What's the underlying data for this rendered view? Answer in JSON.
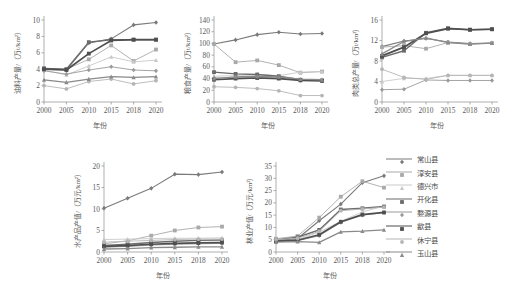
{
  "figure": {
    "xlabel": "年份",
    "x_ticks": [
      "2000",
      "2005",
      "2010",
      "2015",
      "2018",
      "2020"
    ]
  },
  "legend": {
    "position": "right",
    "items": [
      {
        "label": "常山县",
        "color": "#7a7a7a",
        "width": 1.1,
        "marker": "diamond"
      },
      {
        "label": "淳安县",
        "color": "#a9a9a9",
        "width": 0.9,
        "marker": "square"
      },
      {
        "label": "德兴市",
        "color": "#c9c9c9",
        "width": 0.9,
        "marker": "triangle"
      },
      {
        "label": "开化县",
        "color": "#6b6b6b",
        "width": 1.4,
        "marker": "square"
      },
      {
        "label": "婺源县",
        "color": "#9a9a9a",
        "width": 0.9,
        "marker": "diamond"
      },
      {
        "label": "歙县",
        "color": "#4f4f4f",
        "width": 1.7,
        "marker": "square"
      },
      {
        "label": "休宁县",
        "color": "#b5b5b5",
        "width": 0.9,
        "marker": "circle"
      },
      {
        "label": "玉山县",
        "color": "#8a8a8a",
        "width": 1.3,
        "marker": "triangle"
      }
    ]
  },
  "chart_data": [
    {
      "type": "line",
      "id": "oil-crop-yield",
      "title": "",
      "xlabel": "年份",
      "ylabel": "油料产量/（万t/km²）",
      "x": [
        "2000",
        "2005",
        "2010",
        "2015",
        "2018",
        "2020"
      ],
      "ylim": [
        0,
        10
      ],
      "y_ticks": [
        0,
        2,
        4,
        6,
        8,
        10
      ],
      "grid": false,
      "series": [
        {
          "name": "常山县",
          "values": [
            4.0,
            3.9,
            7.2,
            7.7,
            9.4,
            9.7
          ]
        },
        {
          "name": "淳安县",
          "values": [
            4.1,
            4.0,
            5.2,
            6.9,
            5.0,
            6.4
          ]
        },
        {
          "name": "德兴市",
          "values": [
            3.9,
            3.3,
            4.4,
            5.5,
            4.9,
            5.1
          ]
        },
        {
          "name": "开化县",
          "values": [
            4.1,
            4.0,
            7.3,
            7.6,
            7.6,
            7.6
          ]
        },
        {
          "name": "婺源县",
          "values": [
            3.8,
            3.4,
            3.9,
            4.3,
            3.9,
            3.8
          ]
        },
        {
          "name": "歙县",
          "values": [
            4.0,
            3.9,
            5.9,
            7.5,
            7.6,
            7.6
          ]
        },
        {
          "name": "休宁县",
          "values": [
            2.0,
            1.6,
            2.5,
            2.8,
            2.2,
            2.6
          ]
        },
        {
          "name": "玉山县",
          "values": [
            2.7,
            2.4,
            2.8,
            3.1,
            3.0,
            3.1
          ]
        }
      ]
    },
    {
      "type": "line",
      "id": "grain-yield",
      "title": "",
      "xlabel": "年份",
      "ylabel": "粮食产量/（万t/km²）",
      "x": [
        "2000",
        "2005",
        "2010",
        "2015",
        "2018",
        "2020"
      ],
      "ylim": [
        0,
        140
      ],
      "y_ticks": [
        0,
        20,
        40,
        60,
        80,
        100,
        120,
        140
      ],
      "grid": false,
      "series": [
        {
          "name": "常山县",
          "values": [
            99,
            106,
            115,
            119,
            116,
            117
          ]
        },
        {
          "name": "淳安县",
          "values": [
            99,
            68,
            71,
            63,
            50,
            52
          ]
        },
        {
          "name": "德兴市",
          "values": [
            44,
            45,
            47,
            45,
            51,
            52
          ]
        },
        {
          "name": "开化县",
          "values": [
            51,
            48,
            47,
            44,
            38,
            37
          ]
        },
        {
          "name": "婺源县",
          "values": [
            41,
            41,
            42,
            41,
            37,
            37
          ]
        },
        {
          "name": "歙县",
          "values": [
            38,
            40,
            41,
            40,
            37,
            36
          ]
        },
        {
          "name": "休宁县",
          "values": [
            26,
            25,
            23,
            19,
            11,
            11
          ]
        },
        {
          "name": "玉山县",
          "values": [
            40,
            43,
            44,
            43,
            39,
            38
          ]
        }
      ]
    },
    {
      "type": "line",
      "id": "total-meat-output",
      "title": "",
      "xlabel": "年份",
      "ylabel": "肉类总产量/（万t/km²）",
      "x": [
        "2000",
        "2005",
        "2010",
        "2015",
        "2018",
        "2020"
      ],
      "ylim": [
        0,
        16
      ],
      "y_ticks": [
        0,
        4,
        8,
        12,
        16
      ],
      "grid": false,
      "series": [
        {
          "name": "常山县",
          "values": [
            10.8,
            11.9,
            12.4,
            11.7,
            11.4,
            11.5
          ]
        },
        {
          "name": "淳安县",
          "values": [
            10.7,
            11.0,
            10.4,
            11.6,
            11.3,
            11.5
          ]
        },
        {
          "name": "德兴市",
          "values": [
            4.0,
            4.6,
            4.6,
            5.2,
            5.2,
            5.2
          ]
        },
        {
          "name": "开化县",
          "values": [
            8.7,
            10.0,
            13.5,
            14.4,
            14.1,
            14.2
          ]
        },
        {
          "name": "婺源县",
          "values": [
            2.4,
            2.5,
            4.3,
            4.2,
            4.2,
            4.2
          ]
        },
        {
          "name": "歙县",
          "values": [
            9.0,
            10.7,
            13.4,
            14.3,
            14.1,
            14.2
          ]
        },
        {
          "name": "休宁县",
          "values": [
            6.4,
            4.8,
            4.4,
            5.2,
            5.2,
            5.2
          ]
        },
        {
          "name": "玉山县",
          "values": [
            9.4,
            11.8,
            12.5,
            11.6,
            11.3,
            11.5
          ]
        }
      ]
    },
    {
      "type": "line",
      "id": "aquaculture-output-value",
      "title": "",
      "xlabel": "年份",
      "ylabel": "水产品产值/（万元/km²）",
      "x": [
        "2000",
        "2005",
        "2010",
        "2015",
        "2018",
        "2020"
      ],
      "ylim": [
        0,
        20
      ],
      "y_ticks": [
        0,
        5,
        10,
        15,
        20
      ],
      "grid": false,
      "series": [
        {
          "name": "常山县",
          "values": [
            10.2,
            12.5,
            14.8,
            18.1,
            18.0,
            18.6
          ]
        },
        {
          "name": "淳安县",
          "values": [
            1.9,
            2.6,
            3.8,
            5.0,
            5.7,
            5.9
          ]
        },
        {
          "name": "德兴市",
          "values": [
            2.9,
            3.0,
            3.1,
            3.2,
            3.2,
            3.3
          ]
        },
        {
          "name": "开化县",
          "values": [
            1.5,
            1.8,
            2.2,
            2.5,
            2.7,
            2.8
          ]
        },
        {
          "name": "婺源县",
          "values": [
            1.1,
            1.3,
            1.6,
            1.8,
            1.9,
            2.0
          ]
        },
        {
          "name": "歙县",
          "values": [
            1.3,
            1.5,
            1.8,
            2.0,
            2.1,
            2.2
          ]
        },
        {
          "name": "休宁县",
          "values": [
            2.3,
            2.5,
            2.7,
            2.9,
            3.0,
            3.0
          ]
        },
        {
          "name": "玉山县",
          "values": [
            0.7,
            0.8,
            1.0,
            1.1,
            1.2,
            1.2
          ]
        }
      ]
    },
    {
      "type": "line",
      "id": "forestry-output-value",
      "title": "",
      "xlabel": "年份",
      "ylabel": "林业产值/（万元/km²）",
      "x": [
        "2000",
        "2005",
        "2010",
        "2015",
        "2018",
        "2020"
      ],
      "ylim": [
        0,
        35
      ],
      "y_ticks": [
        0,
        5,
        10,
        15,
        20,
        25,
        30,
        35
      ],
      "grid": false,
      "series": [
        {
          "name": "常山县",
          "values": [
            4.6,
            5.5,
            12.7,
            19.5,
            28.2,
            31.0
          ]
        },
        {
          "name": "淳安县",
          "values": [
            5.4,
            6.5,
            14.0,
            22.5,
            28.8,
            26.2
          ]
        },
        {
          "name": "德兴市",
          "values": [
            4.3,
            5.0,
            8.1,
            12.5,
            16.3,
            18.7
          ]
        },
        {
          "name": "开化县",
          "values": [
            4.9,
            6.0,
            9.0,
            17.3,
            17.8,
            18.5
          ]
        },
        {
          "name": "婺源县",
          "values": [
            4.2,
            4.6,
            6.6,
            12.0,
            15.0,
            16.0
          ]
        },
        {
          "name": "歙县",
          "values": [
            4.4,
            4.8,
            7.0,
            12.3,
            15.2,
            16.1
          ]
        },
        {
          "name": "休宁县",
          "values": [
            5.0,
            5.6,
            8.4,
            16.8,
            17.5,
            18.3
          ]
        },
        {
          "name": "玉山县",
          "values": [
            4.0,
            4.2,
            3.9,
            8.2,
            8.5,
            9.0
          ]
        }
      ]
    }
  ]
}
